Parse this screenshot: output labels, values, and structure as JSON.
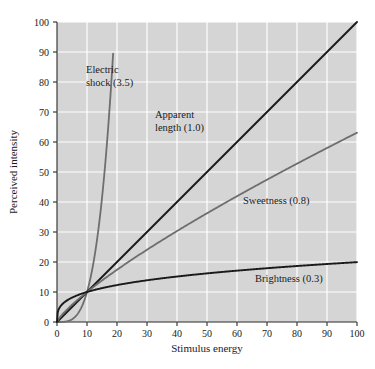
{
  "chart_data": {
    "type": "line",
    "title": "",
    "xlabel": "Stimulus energy",
    "ylabel": "Perceived intensity",
    "xlim": [
      0,
      100
    ],
    "ylim": [
      0,
      100
    ],
    "xticks": [
      0,
      10,
      20,
      30,
      40,
      50,
      60,
      70,
      80,
      90,
      100
    ],
    "yticks": [
      0,
      10,
      20,
      30,
      40,
      50,
      60,
      70,
      80,
      90,
      100
    ],
    "xtick_labels": [
      "0",
      "10",
      "20",
      "30",
      "40",
      "50",
      "60",
      "70",
      "80",
      "90",
      "100"
    ],
    "ytick_labels": [
      "0",
      "10",
      "20",
      "30",
      "40",
      "50",
      "60",
      "70",
      "80",
      "90",
      "100"
    ],
    "grid": true,
    "grid_color": "#ffffff",
    "plot_background": "#d5d5d5",
    "legend": "none",
    "note": "Stevens power law: y = 10 * (x/10)^n, curves cross at (10,10)",
    "series": [
      {
        "name": "Electric shock",
        "exponent": 3.5,
        "label": "Electric shock (3.5)",
        "label_lines": [
          "Electric",
          "shock (3.5)"
        ],
        "color": "#6e6e6e",
        "width": 1.8,
        "x_max": 18.7,
        "points": [
          {
            "x": 0,
            "y": 0
          },
          {
            "x": 2,
            "y": 0.28
          },
          {
            "x": 4,
            "y": 3.16
          },
          {
            "x": 6,
            "y": 12.4
          },
          {
            "x": 8,
            "y": 16.2
          },
          {
            "x": 10,
            "y": 10
          },
          {
            "x": 12,
            "y": 18.9
          },
          {
            "x": 14,
            "y": 32.2
          },
          {
            "x": 16,
            "y": 51.2
          },
          {
            "x": 18,
            "y": 77.2
          },
          {
            "x": 18.7,
            "y": 95
          }
        ]
      },
      {
        "name": "Apparent length",
        "exponent": 1.0,
        "label": "Apparent length (1.0)",
        "label_lines": [
          "Apparent",
          "length (1.0)"
        ],
        "color": "#1a1a1a",
        "width": 1.9,
        "x_max": 100,
        "points": [
          {
            "x": 0,
            "y": 0
          },
          {
            "x": 10,
            "y": 10
          },
          {
            "x": 20,
            "y": 20
          },
          {
            "x": 40,
            "y": 40
          },
          {
            "x": 60,
            "y": 60
          },
          {
            "x": 80,
            "y": 80
          },
          {
            "x": 100,
            "y": 100
          }
        ]
      },
      {
        "name": "Sweetness",
        "exponent": 0.8,
        "label": "Sweetness (0.8)",
        "label_lines": [
          "Sweetness (0.8)"
        ],
        "color": "#6e6e6e",
        "width": 1.8,
        "x_max": 100,
        "points": [
          {
            "x": 0,
            "y": 0
          },
          {
            "x": 10,
            "y": 10
          },
          {
            "x": 20,
            "y": 17.4
          },
          {
            "x": 40,
            "y": 30.3
          },
          {
            "x": 60,
            "y": 42.1
          },
          {
            "x": 80,
            "y": 52.8
          },
          {
            "x": 100,
            "y": 63.1
          }
        ]
      },
      {
        "name": "Brightness",
        "exponent": 0.3,
        "label": "Brightness (0.3)",
        "label_lines": [
          "Brightness (0.3)"
        ],
        "color": "#1a1a1a",
        "width": 1.9,
        "x_max": 100,
        "points": [
          {
            "x": 0,
            "y": 0
          },
          {
            "x": 2,
            "y": 6.4
          },
          {
            "x": 5,
            "y": 8.1
          },
          {
            "x": 10,
            "y": 10
          },
          {
            "x": 20,
            "y": 12.3
          },
          {
            "x": 40,
            "y": 15.2
          },
          {
            "x": 60,
            "y": 17.1
          },
          {
            "x": 80,
            "y": 18.7
          },
          {
            "x": 100,
            "y": 20
          }
        ]
      }
    ],
    "annotations": [
      {
        "name": "electric-shock",
        "text_lines": [
          "Electric",
          "shock (3.5)"
        ],
        "x_px": 86,
        "y_px": 73
      },
      {
        "name": "apparent-length",
        "text_lines": [
          "Apparent",
          "length (1.0)"
        ],
        "x_px": 155,
        "y_px": 118
      },
      {
        "name": "sweetness",
        "text_lines": [
          "Sweetness (0.8)"
        ],
        "x_px": 243,
        "y_px": 204
      },
      {
        "name": "brightness",
        "text_lines": [
          "Brightness (0.3)"
        ],
        "x_px": 255,
        "y_px": 282
      }
    ]
  }
}
